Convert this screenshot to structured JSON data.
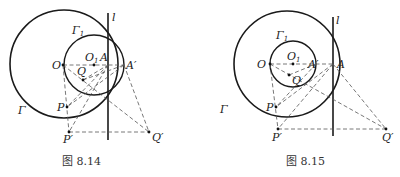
{
  "figures": [
    {
      "caption": "图 8.14",
      "labels": {
        "l": "l",
        "gamma1": "Γ",
        "gamma1_sub": "1",
        "gamma": "Γ",
        "O": "O",
        "O1": "O",
        "O1_sub": "1",
        "A": "A",
        "A_prime": "A′",
        "Q": "Q",
        "P": "P",
        "P_prime": "P′",
        "Q_prime": "Q′"
      }
    },
    {
      "caption": "图 8.15",
      "labels": {
        "l": "l",
        "gamma1": "Γ",
        "gamma1_sub": "1",
        "gamma": "Γ",
        "O": "O",
        "O1": "O",
        "O1_sub": "1",
        "A": "A",
        "A_prime": "A′",
        "Q": "Q",
        "P": "P",
        "P_prime": "P′",
        "Q_prime": "Q′"
      }
    }
  ],
  "colors": {
    "stroke": "#1a1a1a",
    "dash": "#555555",
    "background": "#ffffff"
  }
}
